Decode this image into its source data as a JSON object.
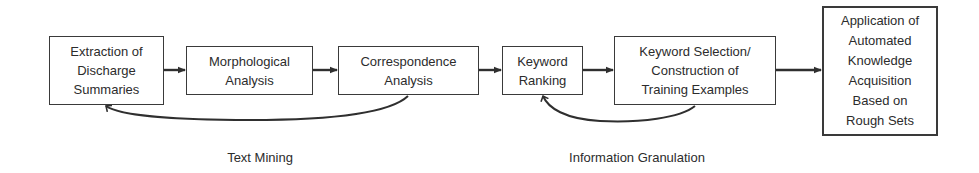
{
  "diagram": {
    "type": "process-flow",
    "nodes": [
      {
        "id": "extraction",
        "label": "Extraction of\nDischarge\nSummaries"
      },
      {
        "id": "morphological",
        "label": "Morphological\nAnalysis"
      },
      {
        "id": "correspondence",
        "label": "Correspondence\nAnalysis"
      },
      {
        "id": "keyword_ranking",
        "label": "Keyword\nRanking"
      },
      {
        "id": "keyword_selection",
        "label": "Keyword Selection/\nConstruction of\nTraining Examples"
      },
      {
        "id": "application",
        "label": "Application of\nAutomated\nKnowledge\nAcquisition\nBased on\nRough Sets"
      }
    ],
    "edges": [
      {
        "from": "extraction",
        "to": "morphological",
        "style": "straight"
      },
      {
        "from": "morphological",
        "to": "correspondence",
        "style": "straight"
      },
      {
        "from": "correspondence",
        "to": "keyword_ranking",
        "style": "straight"
      },
      {
        "from": "keyword_ranking",
        "to": "keyword_selection",
        "style": "straight"
      },
      {
        "from": "keyword_selection",
        "to": "application",
        "style": "straight"
      },
      {
        "from": "correspondence",
        "to": "extraction",
        "style": "curved-feedback"
      },
      {
        "from": "keyword_selection",
        "to": "keyword_ranking",
        "style": "curved-feedback"
      }
    ],
    "groups": [
      {
        "id": "text_mining",
        "label": "Text Mining"
      },
      {
        "id": "information_granulation",
        "label": "Information Granulation"
      }
    ],
    "colors": {
      "stroke": "#2f2f2f",
      "text": "#2c2c2c",
      "background": "#ffffff"
    }
  }
}
